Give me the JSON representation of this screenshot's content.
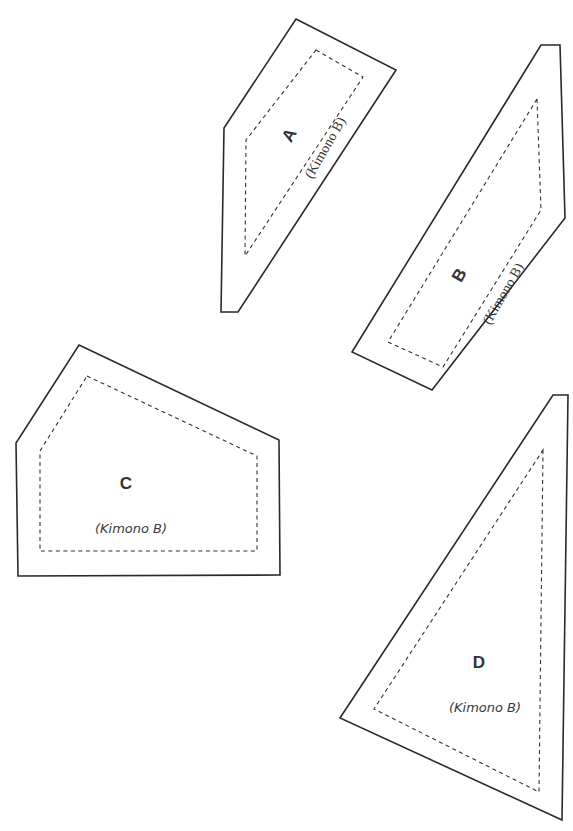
{
  "diagram": {
    "type": "sewing-pattern-pieces",
    "pieces": [
      {
        "id": "A",
        "letter": "A",
        "note": "(Kimono B)",
        "outer": "296,19 396,70 238,312 221,312 224,128",
        "inner": "316,50 363,77 245,256 246,140"
      },
      {
        "id": "B",
        "letter": "B",
        "note": "(Kimono B)",
        "outer": "541,45 560,45 565,218 432,390 352,352",
        "inner": "537,99 541,210 443,367 388,342"
      },
      {
        "id": "C",
        "letter": "C",
        "note": "(Kimono B)",
        "outer": "79,345 279,440 280,575 18,576 16,443",
        "inner": "87,376 257,456 257,551 40,551 40,451"
      },
      {
        "id": "D",
        "letter": "D",
        "note": "(Kimono B)",
        "outer": "553,395 568,395 562,820 340,718",
        "inner": "543,450 539,792 374,709"
      }
    ]
  }
}
